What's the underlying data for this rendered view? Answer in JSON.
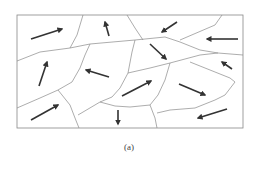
{
  "figure": {
    "caption": "(a)",
    "colors": {
      "border": "#888888",
      "boundary": "#8a8a8a",
      "arrow": "#333333",
      "background": "#ffffff"
    },
    "frame": {
      "x": 17,
      "y": 15,
      "width": 226,
      "height": 113
    },
    "boundaries": [
      "17,61 40,52 70,48 90,44 135,40 165,37",
      "83,15 77,35 70,48",
      "127,15 135,28 143,40",
      "165,37 180,42 200,50 218,53 243,55",
      "222,15 215,25 180,40",
      "90,44 85,55 80,68 72,82 58,90",
      "17,108 40,98 58,90",
      "58,90 70,105 75,118 79,128",
      "135,40 132,52 128,73 120,88 112,97 100,102 78,115",
      "128,73 150,68 170,63 200,55 218,53",
      "100,102 115,106 130,107 150,105",
      "170,63 165,80 158,95 150,105",
      "150,105 155,118 157,128",
      "190,62 210,70 230,78 235,82",
      "235,82 225,95 215,100 195,108 170,110 157,113"
    ],
    "arrows": [
      {
        "x1": 31,
        "y1": 39,
        "x2": 62,
        "y2": 29,
        "dir": "up-right"
      },
      {
        "x1": 109,
        "y1": 36,
        "x2": 105,
        "y2": 22,
        "dir": "up"
      },
      {
        "x1": 177,
        "y1": 22,
        "x2": 162,
        "y2": 32,
        "dir": "down-left"
      },
      {
        "x1": 238,
        "y1": 39,
        "x2": 207,
        "y2": 39,
        "dir": "left"
      },
      {
        "x1": 150,
        "y1": 44,
        "x2": 166,
        "y2": 59,
        "dir": "down-right"
      },
      {
        "x1": 39,
        "y1": 86,
        "x2": 47,
        "y2": 62,
        "dir": "up"
      },
      {
        "x1": 109,
        "y1": 77,
        "x2": 86,
        "y2": 70,
        "dir": "left"
      },
      {
        "x1": 232,
        "y1": 69,
        "x2": 222,
        "y2": 62,
        "dir": "up-left"
      },
      {
        "x1": 122,
        "y1": 96,
        "x2": 151,
        "y2": 81,
        "dir": "up-right"
      },
      {
        "x1": 179,
        "y1": 84,
        "x2": 205,
        "y2": 95,
        "dir": "down-right"
      },
      {
        "x1": 31,
        "y1": 120,
        "x2": 58,
        "y2": 105,
        "dir": "up-right"
      },
      {
        "x1": 118,
        "y1": 110,
        "x2": 118,
        "y2": 124,
        "dir": "down"
      },
      {
        "x1": 227,
        "y1": 109,
        "x2": 198,
        "y2": 118,
        "dir": "down-left"
      }
    ]
  }
}
